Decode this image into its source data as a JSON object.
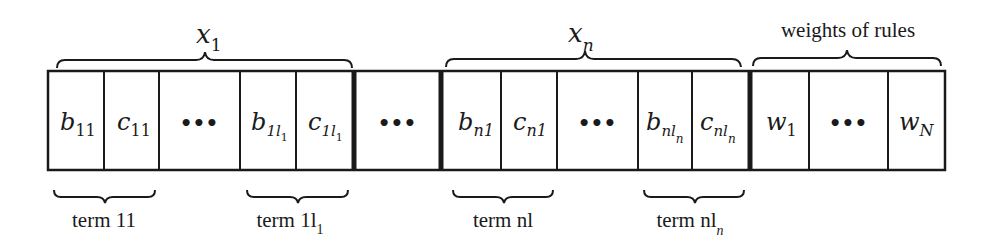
{
  "diagram": {
    "top_groups": [
      {
        "label": "x",
        "sub": "1"
      },
      {
        "label": "x",
        "sub": "n"
      },
      {
        "label": "weights of rules",
        "sub": ""
      }
    ],
    "cells": [
      {
        "main": "b",
        "sub": "11"
      },
      {
        "main": "c",
        "sub": "11"
      },
      {
        "main": "•••",
        "sub": ""
      },
      {
        "main": "b",
        "sub": "1l",
        "subsub": "1"
      },
      {
        "main": "c",
        "sub": "1l",
        "subsub": "1"
      },
      {
        "main": "•••",
        "sub": ""
      },
      {
        "main": "b",
        "sub": "n1"
      },
      {
        "main": "c",
        "sub": "n1"
      },
      {
        "main": "•••",
        "sub": ""
      },
      {
        "main": "b",
        "sub": "nl",
        "subsub": "n"
      },
      {
        "main": "c",
        "sub": "nl",
        "subsub": "n"
      },
      {
        "main": "w",
        "sub": "1"
      },
      {
        "main": "•••",
        "sub": ""
      },
      {
        "main": "w",
        "sub": "N"
      }
    ],
    "bottom_groups": [
      {
        "label": "term 11",
        "sub": ""
      },
      {
        "label": "term 1l",
        "sub": "1"
      },
      {
        "label": "term nl",
        "sub": ""
      },
      {
        "label": "term nl",
        "sub": "n"
      }
    ],
    "colors": {
      "stroke": "#1a1a1a",
      "background": "#ffffff"
    }
  }
}
